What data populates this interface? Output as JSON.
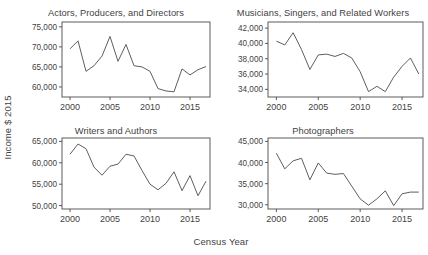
{
  "figure": {
    "xlabel": "Census Year",
    "ylabel": "Income $ 2015",
    "line_color": "#555555",
    "axis_color": "#4a4a4a",
    "background": "#ffffff"
  },
  "chart_data": [
    {
      "type": "line",
      "title": "Actors, Producers, and Directors",
      "xlabel": "Census Year",
      "ylabel": "Income $ 2015",
      "grid": false,
      "legend": "none",
      "xlim": [
        1999,
        2017.5
      ],
      "ylim": [
        57500,
        76200
      ],
      "xticks": [
        2000,
        2005,
        2010,
        2015
      ],
      "xticklabels": [
        "2000",
        "2005",
        "2010",
        "2015"
      ],
      "yticks": [
        60000,
        65000,
        70000,
        75000
      ],
      "yticklabels": [
        "60,000",
        "65,000",
        "70,000",
        "75,000"
      ],
      "x": [
        2000,
        2001,
        2002,
        2003,
        2004,
        2005,
        2006,
        2007,
        2008,
        2009,
        2010,
        2011,
        2012,
        2013,
        2014,
        2015,
        2016,
        2017
      ],
      "values": [
        69500,
        71500,
        63900,
        65300,
        67700,
        72600,
        66400,
        70600,
        65300,
        65000,
        63900,
        59600,
        59000,
        58800,
        64500,
        63000,
        64300,
        65100
      ]
    },
    {
      "type": "line",
      "title": "Musicians, Singers, and Related Workers",
      "xlabel": "Census Year",
      "ylabel": "Income $ 2015",
      "grid": false,
      "legend": "none",
      "xlim": [
        1999,
        2017.5
      ],
      "ylim": [
        33000,
        42800
      ],
      "xticks": [
        2000,
        2005,
        2010,
        2015
      ],
      "xticklabels": [
        "2000",
        "2005",
        "2010",
        "2015"
      ],
      "yticks": [
        34000,
        36000,
        38000,
        40000,
        42000
      ],
      "yticklabels": [
        "34,000",
        "36,000",
        "38,000",
        "40,000",
        "42,000"
      ],
      "x": [
        2000,
        2001,
        2002,
        2003,
        2004,
        2005,
        2006,
        2007,
        2008,
        2009,
        2010,
        2011,
        2012,
        2013,
        2014,
        2015,
        2016,
        2017
      ],
      "values": [
        40300,
        39800,
        41400,
        39200,
        36600,
        38500,
        38600,
        38300,
        38700,
        38100,
        36300,
        33700,
        34400,
        33700,
        35600,
        37000,
        38100,
        36000
      ]
    },
    {
      "type": "line",
      "title": "Writers and Authors",
      "xlabel": "Census Year",
      "ylabel": "Income $ 2015",
      "grid": false,
      "legend": "none",
      "xlim": [
        1999,
        2017.5
      ],
      "ylim": [
        49200,
        65800
      ],
      "xticks": [
        2000,
        2005,
        2010,
        2015
      ],
      "xticklabels": [
        "2000",
        "2005",
        "2010",
        "2015"
      ],
      "yticks": [
        50000,
        55000,
        60000,
        65000
      ],
      "yticklabels": [
        "50,000",
        "55,000",
        "60,000",
        "65,000"
      ],
      "x": [
        2000,
        2001,
        2002,
        2003,
        2004,
        2005,
        2006,
        2007,
        2008,
        2009,
        2010,
        2011,
        2012,
        2013,
        2014,
        2015,
        2016,
        2017
      ],
      "values": [
        62000,
        64400,
        63300,
        59000,
        57100,
        59200,
        59700,
        62000,
        61600,
        58200,
        55000,
        53700,
        55200,
        57900,
        53500,
        57000,
        52300,
        55700
      ]
    },
    {
      "type": "line",
      "title": "Photographers",
      "xlabel": "Census Year",
      "ylabel": "Income $ 2015",
      "grid": false,
      "legend": "none",
      "xlim": [
        1999,
        2017.5
      ],
      "ylim": [
        29000,
        45800
      ],
      "xticks": [
        2000,
        2005,
        2010,
        2015
      ],
      "xticklabels": [
        "2000",
        "2005",
        "2010",
        "2015"
      ],
      "yticks": [
        30000,
        35000,
        40000,
        45000
      ],
      "yticklabels": [
        "30,000",
        "35,000",
        "40,000",
        "45,000"
      ],
      "x": [
        2000,
        2001,
        2002,
        2003,
        2004,
        2005,
        2006,
        2007,
        2008,
        2009,
        2010,
        2011,
        2012,
        2013,
        2014,
        2015,
        2016,
        2017
      ],
      "values": [
        42200,
        38500,
        40400,
        41000,
        35900,
        39900,
        37500,
        37200,
        37400,
        34400,
        31400,
        29900,
        31400,
        33300,
        29800,
        32600,
        33000,
        33000
      ]
    }
  ]
}
